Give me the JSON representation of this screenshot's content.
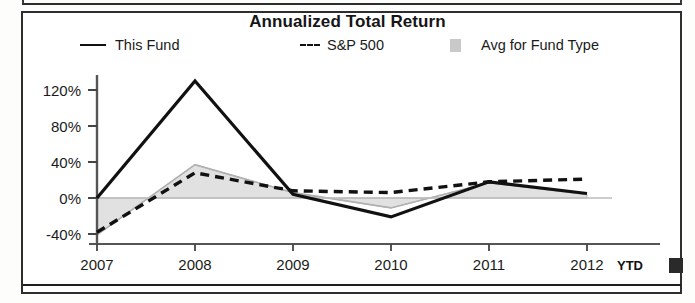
{
  "chart_data": {
    "type": "line",
    "title": "Annualized Total Return",
    "xlabel": "",
    "ylabel": "",
    "x": [
      "2007",
      "2008",
      "2009",
      "2010",
      "2011",
      "2012"
    ],
    "x_note": "YTD",
    "categories": [
      "2007",
      "2008",
      "2009",
      "2010",
      "2011",
      "2012"
    ],
    "ylim": [
      -55,
      140
    ],
    "yticks": [
      -40,
      0,
      40,
      80,
      120
    ],
    "ytick_labels": [
      "-40%",
      "0%",
      "40%",
      "80%",
      "120%"
    ],
    "grid": false,
    "legend_position": "top",
    "series": [
      {
        "name": "This Fund",
        "style": "solid",
        "color": "#111111",
        "values": [
          0,
          130,
          4,
          -21,
          18,
          5
        ]
      },
      {
        "name": "S&P 500",
        "style": "dashed",
        "color": "#111111",
        "values": [
          -38,
          28,
          8,
          6,
          18,
          21
        ]
      },
      {
        "name": "Avg for Fund Type",
        "style": "shaded-band",
        "color": "#c9c9c9",
        "values": [
          -41,
          37,
          6,
          -11,
          17,
          4
        ]
      }
    ],
    "baseline": 0
  },
  "legend": {
    "items": [
      {
        "label": "This Fund",
        "marker": "solid-line"
      },
      {
        "label": "S&P 500",
        "marker": "dashed-line"
      },
      {
        "label": "Avg for Fund Type",
        "marker": "gray-swatch"
      }
    ]
  },
  "axis": {
    "y_ticks": [
      "120%",
      "80%",
      "40%",
      "0%",
      "-40%"
    ],
    "x_ticks": [
      "2007",
      "2008",
      "2009",
      "2010",
      "2011",
      "2012"
    ],
    "ytd_suffix": "YTD"
  },
  "colors": {
    "line": "#111111",
    "band": "#c9c9c9",
    "axis": "#3a3a3a",
    "text": "#1b1b1b",
    "frame": "#2e2e2e"
  }
}
